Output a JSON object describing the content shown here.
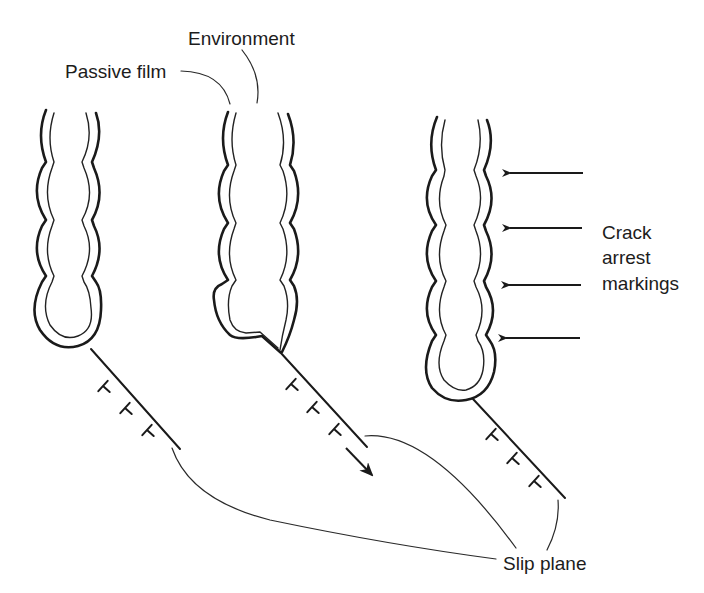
{
  "figure": {
    "colors": {
      "ink": "#1a1a1a",
      "background": "#ffffff"
    }
  },
  "labels": {
    "environment": "Environment",
    "passive_film": "Passive film",
    "crack_arrest": [
      "Crack",
      "arrest",
      "markings"
    ],
    "slip_plane": "Slip plane"
  },
  "stages": [
    {
      "id": "stage-1",
      "description": "Crack tip covered by passive film; dislocations piled on slip plane",
      "dislocations": 3
    },
    {
      "id": "stage-2",
      "description": "Slip step ruptures passive film at crack tip; slip direction arrow",
      "dislocations": 3
    },
    {
      "id": "stage-3",
      "description": "Repassivated crack with arrest markings",
      "dislocations": 3,
      "arrest_arrows": 4
    }
  ],
  "icons": {
    "dislocation": "inverted-T symbol",
    "slip_direction": "arrow-down-right",
    "arrest_marker": "arrow-left"
  }
}
